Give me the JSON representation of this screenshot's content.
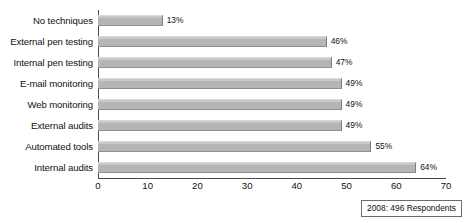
{
  "chart_data": {
    "type": "bar",
    "orientation": "horizontal",
    "title": "",
    "xlabel": "",
    "ylabel": "",
    "xlim": [
      0,
      70
    ],
    "xticks": [
      0,
      10,
      20,
      30,
      40,
      50,
      60,
      70
    ],
    "grid": false,
    "legend": false,
    "categories": [
      "No techniques",
      "External pen testing",
      "Internal pen testing",
      "E-mail monitoring",
      "Web monitoring",
      "External audits",
      "Automated tools",
      "Internal audits"
    ],
    "values": [
      13,
      46,
      47,
      49,
      49,
      49,
      55,
      64
    ],
    "value_labels": [
      "13%",
      "46%",
      "47%",
      "49%",
      "49%",
      "49%",
      "55%",
      "64%"
    ],
    "annotation": "2008: 496 Respondents",
    "bar_color": "#b5b5b5",
    "axis_color": "#4a4a4a",
    "text_color": "#111111"
  }
}
